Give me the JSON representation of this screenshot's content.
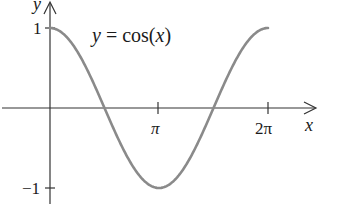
{
  "chart_data": {
    "type": "line",
    "title": "y = cos(x)",
    "annotation": "y = cos(x)",
    "xlabel": "x",
    "ylabel": "y",
    "x_ticks": [
      "π",
      "2π"
    ],
    "x_tick_values": [
      3.14159,
      6.28319
    ],
    "y_ticks": [
      "1",
      "−1"
    ],
    "y_tick_values": [
      1,
      -1
    ],
    "xlim": [
      0,
      6.28319
    ],
    "ylim": [
      -1,
      1
    ],
    "grid": false,
    "legend": "none",
    "series": [
      {
        "name": "cos(x)",
        "x": [
          0,
          0.785,
          1.571,
          2.356,
          3.142,
          3.927,
          4.712,
          5.498,
          6.283
        ],
        "values": [
          1,
          0.707,
          0,
          -0.707,
          -1,
          -0.707,
          0,
          0.707,
          1
        ]
      }
    ],
    "colors": {
      "curve": "#8a8a8a",
      "axes": "#333333"
    }
  }
}
